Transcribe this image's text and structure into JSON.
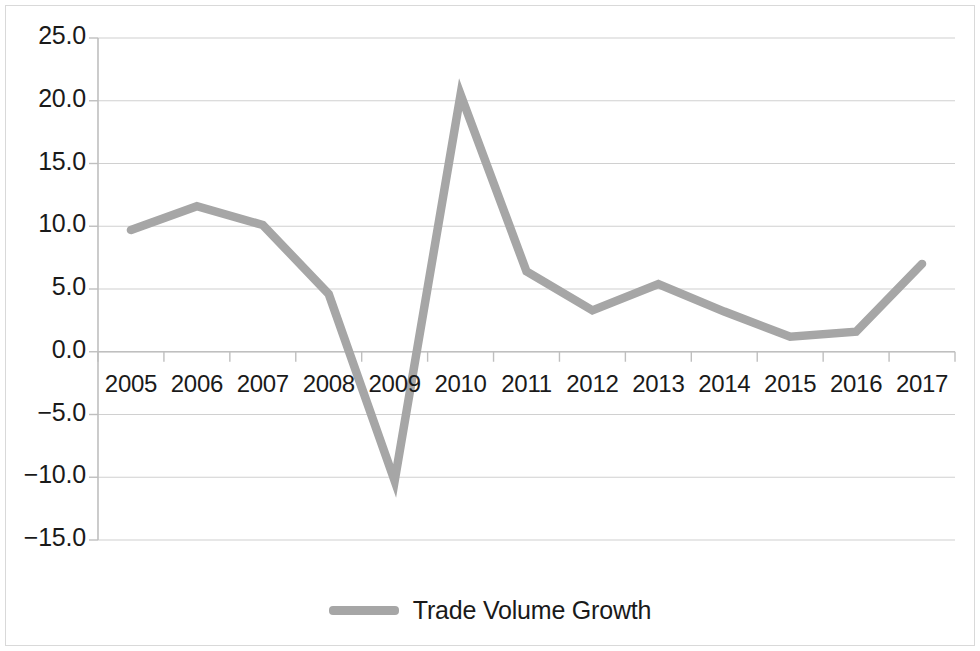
{
  "chart_data": {
    "type": "line",
    "title": "",
    "xlabel": "",
    "ylabel": "",
    "categories": [
      "2005",
      "2006",
      "2007",
      "2008",
      "2009",
      "2010",
      "2011",
      "2012",
      "2013",
      "2014",
      "2015",
      "2016",
      "2017"
    ],
    "series": [
      {
        "name": "Trade Volume Growth",
        "color": "#a6a6a6",
        "values": [
          9.7,
          11.6,
          10.1,
          4.6,
          -10.3,
          20.5,
          6.4,
          3.3,
          5.4,
          3.2,
          1.2,
          1.6,
          7.0
        ]
      }
    ],
    "ylim": [
      -15.0,
      25.0
    ],
    "ytick_labels": [
      "25.0",
      "20.0",
      "15.0",
      "10.0",
      "5.0",
      "0.0",
      "−5.0",
      "−10.0",
      "−15.0"
    ],
    "ytick_values": [
      25.0,
      20.0,
      15.0,
      10.0,
      5.0,
      0.0,
      -5.0,
      -10.0,
      -15.0
    ],
    "grid": true,
    "grid_axis": "y",
    "grid_color": "#d0d0d0",
    "axis_color": "#bfbfbf",
    "legend_position": "bottom",
    "legend_entries": [
      "Trade Volume Growth"
    ],
    "xaxis_label_position": "below-zero-line"
  },
  "legend": {
    "label": "Trade Volume Growth"
  }
}
